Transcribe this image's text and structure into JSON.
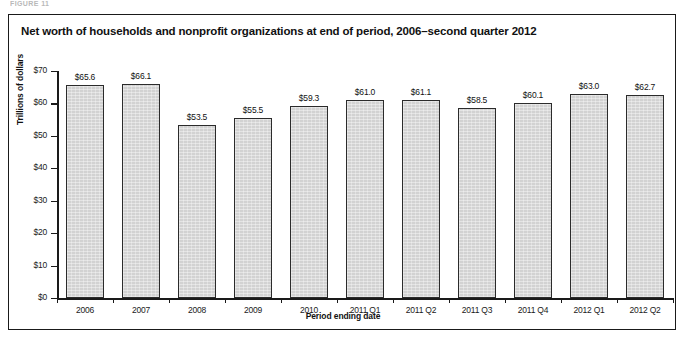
{
  "figure": {
    "caption_sliver": "FIGURE 11",
    "title": "Net worth of households and nonprofit organizations at end of period, 2006–second quarter 2012"
  },
  "chart_data": {
    "type": "bar",
    "title": "Net worth of households and nonprofit organizations at end of period, 2006–second quarter 2012",
    "xlabel": "Period ending date",
    "ylabel": "Trillions of dollars",
    "categories": [
      "2006",
      "2007",
      "2008",
      "2009",
      "2010",
      "2011 Q1",
      "2011 Q2",
      "2011 Q3",
      "2011 Q4",
      "2012 Q1",
      "2012 Q2"
    ],
    "values": [
      65.6,
      66.1,
      53.5,
      55.5,
      59.3,
      61.0,
      61.1,
      58.5,
      60.1,
      63.0,
      62.7
    ],
    "data_labels": [
      "$65.6",
      "$66.1",
      "$53.5",
      "$55.5",
      "$59.3",
      "$61.0",
      "$61.1",
      "$58.5",
      "$60.1",
      "$63.0",
      "$62.7"
    ],
    "ylim": [
      0,
      70
    ],
    "ytick_values": [
      0,
      10,
      20,
      30,
      40,
      50,
      60,
      70
    ],
    "ytick_labels": [
      "$0",
      "$10",
      "$20",
      "$30",
      "$40",
      "$50",
      "$60",
      "$70"
    ],
    "grid": false,
    "legend": null,
    "bar_color": "#d2d2d2",
    "bar_edge_color": "#2b2b2b",
    "axis_color": "#1a1a1a",
    "background": "#ffffff"
  }
}
